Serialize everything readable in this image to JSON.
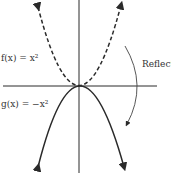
{
  "labels": {
    "f": "f(x) = x²",
    "g": "g(x) = −x²",
    "reflect": "Reflect"
  },
  "colors": {
    "stroke": "#2a2a2a",
    "text": "#333333"
  }
}
